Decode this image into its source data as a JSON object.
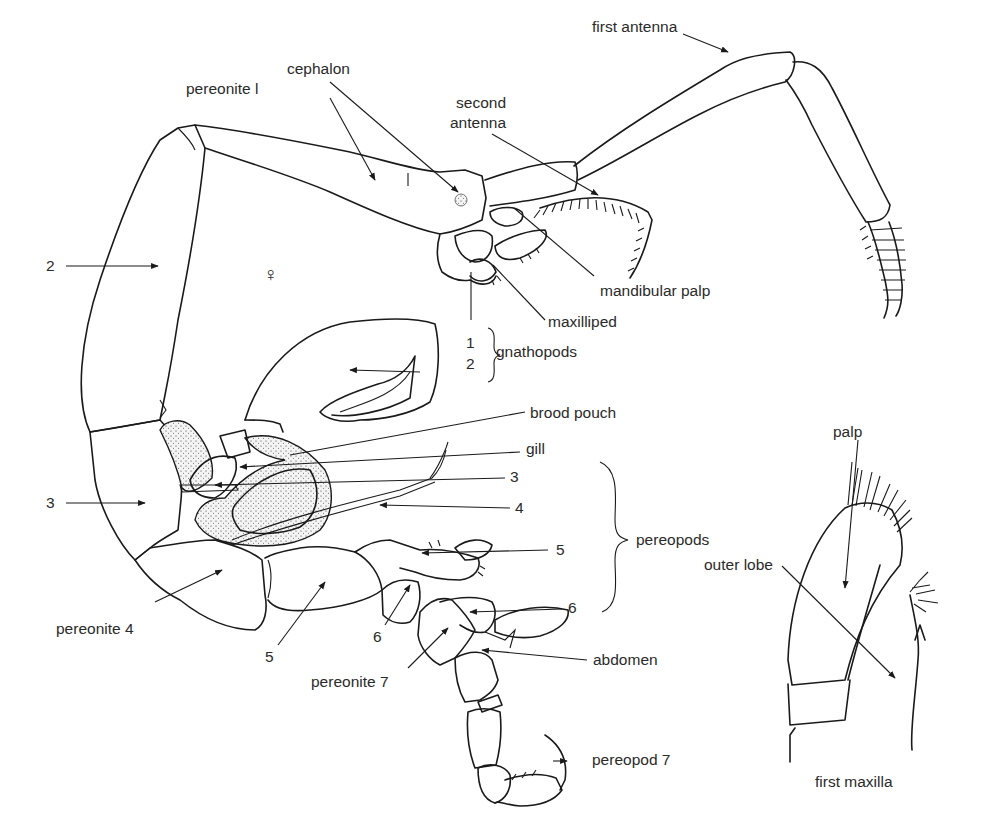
{
  "figure": {
    "sex_symbol": "♀",
    "labels": {
      "first_antenna": "first antenna",
      "cephalon": "cephalon",
      "pereonite_1": "pereonite l",
      "second_antenna_line1": "second",
      "second_antenna_line2": "antenna",
      "mandibular_palp": "mandibular palp",
      "maxilliped": "maxilliped",
      "gnathopod_1": "1",
      "gnathopod_2": "2",
      "gnathopods": "gnathopods",
      "pereonite_2": "2",
      "pereonite_3": "3",
      "pereonite_4": "pereonite 4",
      "pereonite_5": "5",
      "pereonite_6": "6",
      "pereonite_7": "pereonite 7",
      "brood_pouch": "brood pouch",
      "gill": "gill",
      "pereopod_3": "3",
      "pereopod_4": "4",
      "pereopod_5": "5",
      "pereopod_6": "6",
      "pereopods": "pereopods",
      "abdomen": "abdomen",
      "pereopod_7": "pereopod 7"
    },
    "inset": {
      "palp": "palp",
      "outer_lobe": "outer lobe",
      "caption": "first maxilla"
    }
  }
}
